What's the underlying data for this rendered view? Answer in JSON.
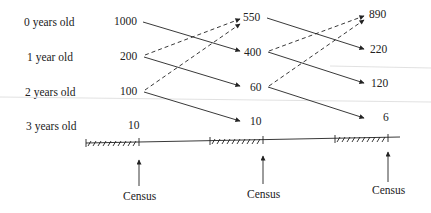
{
  "diagram": {
    "type": "population-age-transition",
    "row_labels": [
      "0 years old",
      "1 year old",
      "2 years old",
      "3 years old"
    ],
    "columns": [
      {
        "values": [
          "1000",
          "200",
          "100",
          "10"
        ]
      },
      {
        "values": [
          "550",
          "400",
          "60",
          "10"
        ]
      },
      {
        "values": [
          "890",
          "220",
          "120",
          "6"
        ]
      }
    ],
    "census_label": "Census",
    "census_labels": [
      "Census",
      "Census",
      "Census"
    ],
    "edges": {
      "survival_solid": [
        {
          "from": "col1.0 (1000)",
          "to": "col2.1 (400)"
        },
        {
          "from": "col1.1 (200)",
          "to": "col2.2 (60)"
        },
        {
          "from": "col1.2 (100)",
          "to": "col2.3 (10)"
        },
        {
          "from": "col2.0 (550)",
          "to": "col3.1 (220)"
        },
        {
          "from": "col2.1 (400)",
          "to": "col3.2 (120)"
        },
        {
          "from": "col2.2 (60)",
          "to": "col3.3 (6)"
        }
      ],
      "reproduction_dashed": [
        {
          "from": "col1.1 (200)",
          "to": "col2.0 (550)"
        },
        {
          "from": "col1.2 (100)",
          "to": "col2.0 (550)"
        },
        {
          "from": "col2.1 (400)",
          "to": "col3.0 (890)"
        },
        {
          "from": "col2.2 (60)",
          "to": "col3.0 (890)"
        }
      ]
    }
  }
}
